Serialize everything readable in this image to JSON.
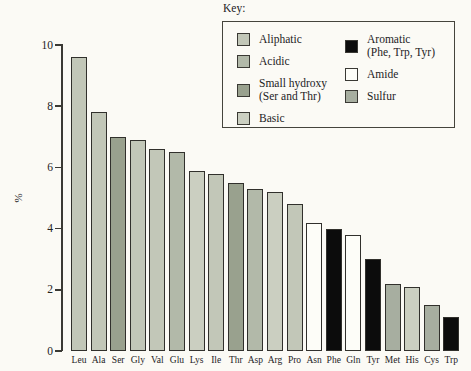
{
  "page": {
    "background": "#fbfaf5"
  },
  "key": {
    "title": "Key:",
    "columns": [
      [
        {
          "label": "Aliphatic",
          "sublabel": "",
          "group": "aliphatic"
        },
        {
          "label": "Acidic",
          "sublabel": "",
          "group": "acidic"
        },
        {
          "label": "Small hydroxy",
          "sublabel": "(Ser and Thr)",
          "group": "small_hydroxy"
        },
        {
          "label": "Basic",
          "sublabel": "",
          "group": "basic"
        }
      ],
      [
        {
          "label": "Aromatic",
          "sublabel": "(Phe, Trp, Tyr)",
          "group": "aromatic"
        },
        {
          "label": "Amide",
          "sublabel": "",
          "group": "amide"
        },
        {
          "label": "Sulfur",
          "sublabel": "",
          "group": "sulfur"
        }
      ]
    ]
  },
  "colors": {
    "aliphatic": "#c2c7b8",
    "acidic": "#b2b9a9",
    "small_hydroxy": "#99a18e",
    "basic": "#cbcfc1",
    "aromatic": "#0c0c0c",
    "amide": "#fdfdf8",
    "sulfur": "#a7aea0",
    "bar_border": "#31302c",
    "axis": "#3a3934",
    "text": "#23221e"
  },
  "chart_data": {
    "type": "bar",
    "title": "",
    "xlabel": "",
    "ylabel": "%",
    "ylim": [
      0,
      10
    ],
    "yticks": [
      0,
      2,
      4,
      6,
      8,
      10
    ],
    "grid": false,
    "legend_position": "top-right",
    "categories": [
      "Leu",
      "Ala",
      "Ser",
      "Gly",
      "Val",
      "Glu",
      "Lys",
      "Ile",
      "Thr",
      "Asp",
      "Arg",
      "Pro",
      "Asn",
      "Phe",
      "Gln",
      "Tyr",
      "Met",
      "His",
      "Cys",
      "Trp"
    ],
    "values": [
      9.6,
      7.8,
      7.0,
      6.9,
      6.6,
      6.5,
      5.9,
      5.8,
      5.5,
      5.3,
      5.2,
      4.8,
      4.2,
      4.0,
      3.8,
      3.0,
      2.2,
      2.1,
      1.5,
      1.1
    ],
    "groups": [
      "aliphatic",
      "aliphatic",
      "small_hydroxy",
      "aliphatic",
      "aliphatic",
      "acidic",
      "basic",
      "aliphatic",
      "small_hydroxy",
      "acidic",
      "basic",
      "aliphatic",
      "amide",
      "aromatic",
      "amide",
      "aromatic",
      "sulfur",
      "basic",
      "sulfur",
      "aromatic"
    ]
  }
}
